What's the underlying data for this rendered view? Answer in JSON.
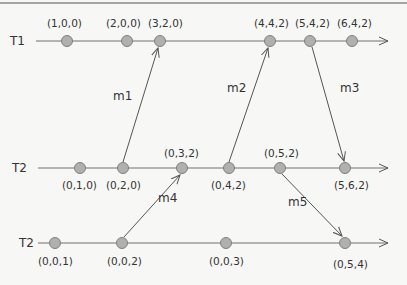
{
  "diagram": {
    "type": "vector-clock timeline",
    "processes": [
      {
        "label": "T1",
        "y": 41,
        "events": [
          {
            "clock": "(1,0,0)",
            "x": 67
          },
          {
            "clock": "(2,0,0)",
            "x": 127
          },
          {
            "clock": "(3,2,0)",
            "x": 160
          },
          {
            "clock": "(4,4,2)",
            "x": 270
          },
          {
            "clock": "(5,4,2)",
            "x": 310
          },
          {
            "clock": "(6,4,2)",
            "x": 352
          }
        ]
      },
      {
        "label": "T2",
        "y": 168,
        "events": [
          {
            "clock": "(0,1,0)",
            "x": 80
          },
          {
            "clock": "(0,2,0)",
            "x": 123
          },
          {
            "clock": "(0,3,2)",
            "x": 182
          },
          {
            "clock": "(0,4,2)",
            "x": 229
          },
          {
            "clock": "(0,5,2)",
            "x": 280
          },
          {
            "clock": "(5,6,2)",
            "x": 345
          }
        ]
      },
      {
        "label": "T2",
        "y": 243,
        "events": [
          {
            "clock": "(0,0,1)",
            "x": 55
          },
          {
            "clock": "(0,0,2)",
            "x": 122
          },
          {
            "clock": "(0,0,3)",
            "x": 226
          },
          {
            "clock": "(0,5,4)",
            "x": 345
          }
        ]
      }
    ],
    "messages": [
      {
        "label": "m1"
      },
      {
        "label": "m2"
      },
      {
        "label": "m3"
      },
      {
        "label": "m4"
      },
      {
        "label": "m5"
      }
    ],
    "colors": {
      "node_fill": "#b0b0b0",
      "node_stroke": "#808080",
      "line": "#707070",
      "text": "#333333"
    }
  }
}
